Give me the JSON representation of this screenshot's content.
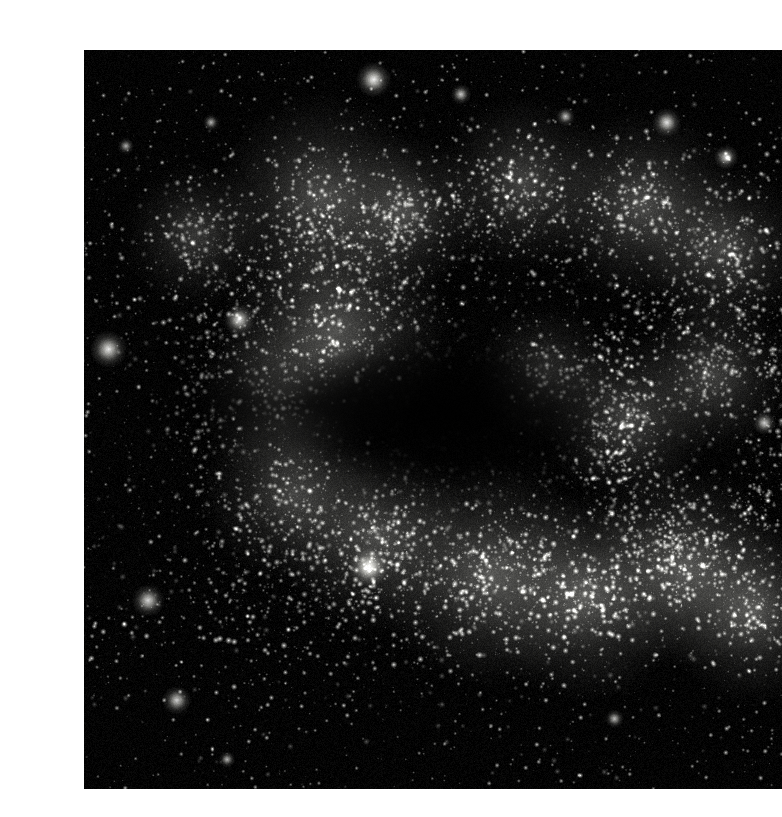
{
  "page": {
    "background_color": "#ffffff",
    "width": 742,
    "height": 817
  },
  "plate": {
    "name": "astronomical-photograph",
    "subject": "edge-on spiral galaxy star field",
    "rendering": "monochrome grayscale",
    "background_color": "#030303",
    "star_color": "#ffffff",
    "nebula_color": "#c8c8c2",
    "bounds": {
      "x": 44,
      "y": 34,
      "width": 698,
      "height": 739
    },
    "alt_text": "Dense monochrome star field showing an edge-on spiral galaxy with two bright stellar arm bands separated by a dark dust lane, scattered foreground stars and diffuse star clusters."
  },
  "chart_data": {
    "type": "scatter",
    "title": "",
    "xlabel": "",
    "ylabel": "",
    "grid": false,
    "legend": "none",
    "xlim": [
      0,
      698
    ],
    "ylim": [
      0,
      739
    ],
    "background": "#030303",
    "structures": [
      {
        "name": "upper-arm-band",
        "kind": "band",
        "cx_frac": 0.56,
        "cy_frac": 0.24,
        "rx_frac": 0.62,
        "ry_frac": 0.085,
        "tilt_deg": -7,
        "density": 2600,
        "brightness": 0.78
      },
      {
        "name": "lower-arm-band",
        "kind": "band",
        "cx_frac": 0.62,
        "cy_frac": 0.72,
        "rx_frac": 0.64,
        "ry_frac": 0.085,
        "tilt_deg": -5,
        "density": 3000,
        "brightness": 0.92
      },
      {
        "name": "left-arc-loop",
        "kind": "arc",
        "cx_frac": 0.33,
        "cy_frac": 0.49,
        "rx_frac": 0.2,
        "ry_frac": 0.27,
        "tilt_deg": 0,
        "density": 1700,
        "brightness": 0.7
      },
      {
        "name": "right-inner-ring",
        "kind": "arc",
        "cx_frac": 0.88,
        "cy_frac": 0.5,
        "rx_frac": 0.17,
        "ry_frac": 0.2,
        "tilt_deg": 0,
        "density": 1500,
        "brightness": 0.8
      },
      {
        "name": "diffuse-halo",
        "kind": "halo",
        "cx_frac": 0.55,
        "cy_frac": 0.5,
        "rx_frac": 0.8,
        "ry_frac": 0.52,
        "tilt_deg": 0,
        "density": 5200,
        "brightness": 0.34
      },
      {
        "name": "central-dust-void",
        "kind": "void",
        "cx_frac": 0.52,
        "cy_frac": 0.49,
        "rx_frac": 0.26,
        "ry_frac": 0.13
      }
    ],
    "bright_clusters": [
      {
        "cx_frac": 0.34,
        "cy_frac": 0.2,
        "r_frac": 0.05,
        "brightness": 0.8
      },
      {
        "cx_frac": 0.46,
        "cy_frac": 0.22,
        "r_frac": 0.038,
        "brightness": 0.72
      },
      {
        "cx_frac": 0.16,
        "cy_frac": 0.25,
        "r_frac": 0.035,
        "brightness": 0.58
      },
      {
        "cx_frac": 0.63,
        "cy_frac": 0.18,
        "r_frac": 0.042,
        "brightness": 0.7
      },
      {
        "cx_frac": 0.8,
        "cy_frac": 0.21,
        "r_frac": 0.046,
        "brightness": 0.78
      },
      {
        "cx_frac": 0.92,
        "cy_frac": 0.27,
        "r_frac": 0.04,
        "brightness": 0.72
      },
      {
        "cx_frac": 0.36,
        "cy_frac": 0.38,
        "r_frac": 0.055,
        "brightness": 0.86
      },
      {
        "cx_frac": 0.28,
        "cy_frac": 0.47,
        "r_frac": 0.04,
        "brightness": 0.66
      },
      {
        "cx_frac": 0.3,
        "cy_frac": 0.6,
        "r_frac": 0.044,
        "brightness": 0.72
      },
      {
        "cx_frac": 0.42,
        "cy_frac": 0.66,
        "r_frac": 0.046,
        "brightness": 0.78
      },
      {
        "cx_frac": 0.58,
        "cy_frac": 0.71,
        "r_frac": 0.054,
        "brightness": 0.9
      },
      {
        "cx_frac": 0.72,
        "cy_frac": 0.74,
        "r_frac": 0.05,
        "brightness": 0.92
      },
      {
        "cx_frac": 0.86,
        "cy_frac": 0.7,
        "r_frac": 0.048,
        "brightness": 0.88
      },
      {
        "cx_frac": 0.96,
        "cy_frac": 0.76,
        "r_frac": 0.044,
        "brightness": 0.84
      },
      {
        "cx_frac": 0.78,
        "cy_frac": 0.5,
        "r_frac": 0.04,
        "brightness": 0.7
      },
      {
        "cx_frac": 0.9,
        "cy_frac": 0.44,
        "r_frac": 0.038,
        "brightness": 0.68
      },
      {
        "cx_frac": 0.66,
        "cy_frac": 0.44,
        "r_frac": 0.034,
        "brightness": 0.6
      }
    ],
    "foreground_stars": [
      {
        "cx_frac": 0.415,
        "cy_frac": 0.04,
        "r": 8.5,
        "brightness": 0.95
      },
      {
        "cx_frac": 0.835,
        "cy_frac": 0.098,
        "r": 7.0,
        "brightness": 0.88
      },
      {
        "cx_frac": 0.92,
        "cy_frac": 0.145,
        "r": 6.0,
        "brightness": 0.82
      },
      {
        "cx_frac": 0.222,
        "cy_frac": 0.365,
        "r": 7.5,
        "brightness": 0.86
      },
      {
        "cx_frac": 0.035,
        "cy_frac": 0.405,
        "r": 9.0,
        "brightness": 0.9
      },
      {
        "cx_frac": 0.092,
        "cy_frac": 0.745,
        "r": 8.0,
        "brightness": 0.84
      },
      {
        "cx_frac": 0.133,
        "cy_frac": 0.88,
        "r": 7.0,
        "brightness": 0.8
      },
      {
        "cx_frac": 0.408,
        "cy_frac": 0.7,
        "r": 9.5,
        "brightness": 0.92
      },
      {
        "cx_frac": 0.54,
        "cy_frac": 0.06,
        "r": 5.0,
        "brightness": 0.78
      },
      {
        "cx_frac": 0.69,
        "cy_frac": 0.09,
        "r": 4.5,
        "brightness": 0.72
      },
      {
        "cx_frac": 0.182,
        "cy_frac": 0.098,
        "r": 4.0,
        "brightness": 0.7
      },
      {
        "cx_frac": 0.06,
        "cy_frac": 0.13,
        "r": 4.0,
        "brightness": 0.66
      },
      {
        "cx_frac": 0.975,
        "cy_frac": 0.505,
        "r": 5.5,
        "brightness": 0.8
      },
      {
        "cx_frac": 0.76,
        "cy_frac": 0.905,
        "r": 4.5,
        "brightness": 0.74
      },
      {
        "cx_frac": 0.205,
        "cy_frac": 0.96,
        "r": 4.0,
        "brightness": 0.7
      }
    ]
  }
}
